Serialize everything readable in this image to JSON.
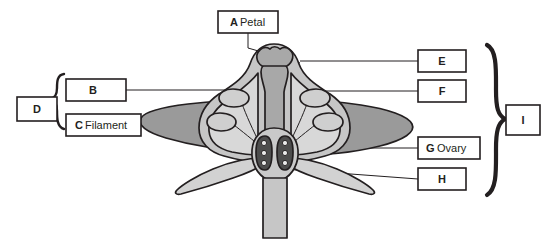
{
  "diagram": {
    "background_color": "#ffffff",
    "ink_color": "#231f20",
    "fills": {
      "petal_dark_gray": "#9a9a9a",
      "corolla_light_gray": "#c6c6c6",
      "style_mid_gray": "#a8a8a8",
      "sepal_pale_gray": "#d2d2d2",
      "ovary_pale": "#c9c9c9",
      "ovule_chamber_dark": "#4d4d4d",
      "ovule_dot": "#e8e8e8",
      "anther_light": "#cfcfcf"
    }
  },
  "labels": [
    {
      "id": "A",
      "letter": "A",
      "word": "Petal",
      "has_word": true,
      "box": {
        "x": 218,
        "y": 11,
        "w": 60,
        "h": 22
      }
    },
    {
      "id": "B",
      "letter": "B",
      "word": "",
      "has_word": false,
      "box": {
        "x": 66,
        "y": 79,
        "w": 60,
        "h": 22
      }
    },
    {
      "id": "C",
      "letter": "C",
      "word": "Filament",
      "has_word": true,
      "box": {
        "x": 66,
        "y": 114,
        "w": 75,
        "h": 22
      }
    },
    {
      "id": "D",
      "letter": "D",
      "word": "",
      "has_word": false,
      "box": {
        "x": 17,
        "y": 97,
        "w": 40,
        "h": 24
      }
    },
    {
      "id": "E",
      "letter": "E",
      "word": "",
      "has_word": false,
      "box": {
        "x": 418,
        "y": 50,
        "w": 48,
        "h": 22
      }
    },
    {
      "id": "F",
      "letter": "F",
      "word": "",
      "has_word": false,
      "box": {
        "x": 418,
        "y": 80,
        "w": 48,
        "h": 22
      }
    },
    {
      "id": "G",
      "letter": "G",
      "word": "Ovary",
      "has_word": true,
      "box": {
        "x": 418,
        "y": 137,
        "w": 62,
        "h": 22
      }
    },
    {
      "id": "H",
      "letter": "H",
      "word": "",
      "has_word": false,
      "box": {
        "x": 418,
        "y": 168,
        "w": 48,
        "h": 22
      }
    },
    {
      "id": "I",
      "letter": "I",
      "word": "",
      "has_word": false,
      "box": {
        "x": 506,
        "y": 105,
        "w": 34,
        "h": 30
      }
    }
  ],
  "brackets": [
    {
      "id": "D-bracket",
      "groups": [
        "B",
        "C"
      ],
      "side": "left"
    },
    {
      "id": "I-bracket",
      "groups": [
        "E",
        "F",
        "G",
        "H"
      ],
      "side": "right"
    }
  ],
  "structures": [
    {
      "name": "petal-left",
      "label_ref": "A"
    },
    {
      "name": "petal-right",
      "label_ref": "A"
    },
    {
      "name": "stigma",
      "label_ref": "E"
    },
    {
      "name": "anther",
      "label_ref": "B"
    },
    {
      "name": "filament",
      "label_ref": "C"
    },
    {
      "name": "style",
      "label_ref": "F"
    },
    {
      "name": "ovary",
      "label_ref": "G"
    },
    {
      "name": "sepal",
      "label_ref": "H"
    }
  ]
}
